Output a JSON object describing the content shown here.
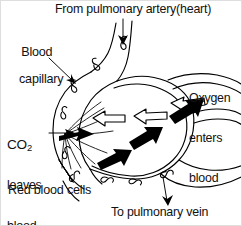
{
  "figure": {
    "width": 242,
    "height": 226,
    "background_color": "#ffffff",
    "ink_color": "#000000",
    "border_color": "#dedede"
  },
  "labels": {
    "from_artery": "From pulmonary artery(heart)",
    "capillary_line1": "Blood",
    "capillary_line2": "capillary",
    "oxygen_line1": "Oxygen",
    "oxygen_line2": "enters",
    "oxygen_line3": "blood",
    "co2_formula": "CO",
    "co2_subscript": "2",
    "co2_line2": "leaves",
    "co2_line3": "blood",
    "red_blood_cells": "Red blood cells",
    "to_vein": "To pulmonary vein"
  },
  "diagram": {
    "oxygen_arrow_style": "hollow-outline",
    "oxygen_arrow_direction": "right-to-left into capillary",
    "oxygen_arrow_count": 3,
    "co2_arrow_style": "solid-black",
    "co2_arrow_direction": "left-to-right out of capillary",
    "co2_arrow_count": 4,
    "red_blood_cell_count": 9,
    "red_blood_cell_shape": "biconcave figure-eight outline",
    "inflow_arrow": "down-pointing at top vessel",
    "outflow_arrow": "down-pointing at bottom-right vessel",
    "capillary_shape": "loop encircling alveolus",
    "leader_lines": [
      "blood-capillary to upper-left capillary wall",
      "co2-leaves-blood to capillary wall at left",
      "red-blood-cells to cell inside lower-left capillary"
    ]
  }
}
